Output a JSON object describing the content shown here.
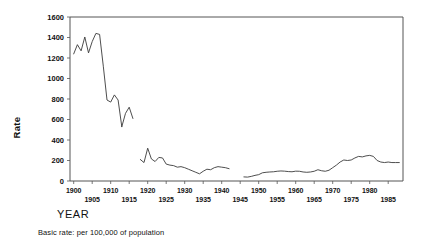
{
  "figure": {
    "ylabel": "Rate",
    "xtitle": "YEAR",
    "caption": "Basic rate: per 100,000 of population"
  },
  "chart_data": {
    "type": "line",
    "title": "",
    "subtitle": "",
    "xlabel": "YEAR",
    "ylabel": "Rate",
    "annotations": [
      "Basic rate: per 100,000 of population"
    ],
    "legend": [],
    "legend_position": "none",
    "grid": false,
    "xlim": [
      1899,
      1989
    ],
    "ylim": [
      0,
      1600
    ],
    "yticks": [
      0,
      200,
      400,
      600,
      800,
      1000,
      1200,
      1400,
      1600
    ],
    "ytick_labels": [
      "0",
      "200",
      "400",
      "600",
      "800",
      "1000",
      "1200",
      "1400",
      "1600"
    ],
    "xticks": [
      1900,
      1905,
      1910,
      1915,
      1920,
      1925,
      1930,
      1935,
      1940,
      1945,
      1950,
      1955,
      1960,
      1965,
      1970,
      1975,
      1980,
      1985
    ],
    "xtick_labels": [
      "1900",
      "1905",
      "1910",
      "1915",
      "1920",
      "1925",
      "1930",
      "1935",
      "1940",
      "1945",
      "1950",
      "1955",
      "1960",
      "1965",
      "1970",
      "1975",
      "1980",
      "1985"
    ],
    "xtick_label_rows": [
      0,
      1,
      0,
      1,
      0,
      1,
      0,
      1,
      0,
      1,
      0,
      1,
      0,
      1,
      0,
      1,
      0,
      1
    ],
    "line_color": "#3a3a3a",
    "series": [
      {
        "name": "segment-1",
        "x": [
          1900,
          1901,
          1902,
          1903,
          1904,
          1905,
          1906,
          1907,
          1908,
          1909,
          1910,
          1911,
          1912,
          1913
        ],
        "values": [
          1240,
          1330,
          1270,
          1405,
          1250,
          1360,
          1440,
          1430,
          1120,
          790,
          770,
          840,
          790,
          530
        ]
      },
      {
        "name": "segment-1b",
        "x": [
          1913,
          1914,
          1915,
          1916
        ],
        "values": [
          530,
          660,
          720,
          610
        ]
      },
      {
        "name": "segment-2",
        "x": [
          1918,
          1919,
          1920,
          1921,
          1922,
          1923,
          1924,
          1925,
          1926,
          1927,
          1928,
          1929,
          1930,
          1931,
          1932,
          1933,
          1934,
          1935,
          1936,
          1937,
          1938,
          1939,
          1940,
          1941,
          1942
        ],
        "values": [
          210,
          180,
          320,
          215,
          190,
          230,
          225,
          165,
          155,
          150,
          135,
          140,
          130,
          115,
          100,
          85,
          70,
          95,
          115,
          110,
          130,
          140,
          135,
          130,
          120
        ]
      },
      {
        "name": "segment-3",
        "x": [
          1946,
          1947,
          1948,
          1949,
          1950,
          1951,
          1952,
          1953,
          1954,
          1955,
          1956,
          1957,
          1958,
          1959,
          1960,
          1961,
          1962,
          1963,
          1964,
          1965,
          1966,
          1967,
          1968,
          1969,
          1970,
          1971,
          1972,
          1973,
          1974,
          1975,
          1976,
          1977,
          1978,
          1979,
          1980,
          1981,
          1982,
          1983,
          1984,
          1985,
          1986,
          1987,
          1988
        ],
        "values": [
          40,
          38,
          45,
          55,
          62,
          80,
          85,
          88,
          90,
          95,
          98,
          96,
          92,
          90,
          96,
          95,
          88,
          85,
          88,
          95,
          110,
          100,
          95,
          105,
          130,
          155,
          185,
          205,
          200,
          205,
          225,
          240,
          235,
          245,
          250,
          240,
          200,
          185,
          180,
          185,
          180,
          180,
          180
        ]
      }
    ]
  }
}
